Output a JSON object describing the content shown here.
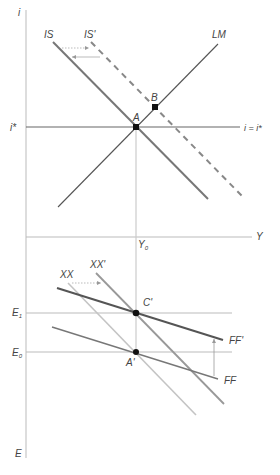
{
  "top_panel": {
    "axes": {
      "y_label": "i",
      "x_label": "Y",
      "istar_label": "i*",
      "parity_label": "i = i*",
      "y0_label": "Y",
      "y0_sub": "0"
    },
    "curves": {
      "is_label": "IS",
      "is_prime_label": "IS'",
      "lm_label": "LM"
    },
    "points": {
      "a_label": "A",
      "b_label": "B"
    }
  },
  "bottom_panel": {
    "axes": {
      "y_label": "E",
      "e1_label": "E",
      "e1_sub": "1",
      "e0_label": "E",
      "e0_sub": "0"
    },
    "curves": {
      "xx_label": "XX",
      "xx_prime_label": "XX'",
      "ff_label": "FF",
      "ff_prime_label": "FF'"
    },
    "points": {
      "c_prime_label": "C'",
      "a_prime_label": "A'"
    }
  },
  "colors": {
    "axis": "#bbbbbb",
    "is_curve": "#777777",
    "is_prime_curve": "#888888",
    "lm_curve": "#555555",
    "parity_line": "#666666",
    "ff_prime_curve": "#555555",
    "ff_curve": "#777777",
    "xx_curve": "#bbbbbb",
    "xx_prime_curve": "#999999",
    "point": "#111111"
  }
}
